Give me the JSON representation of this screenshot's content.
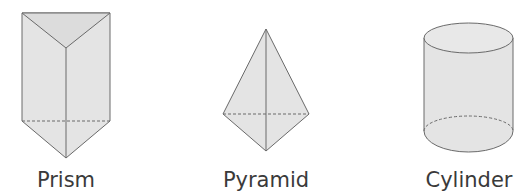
{
  "shapes": [
    {
      "name": "prism",
      "label": "Prism"
    },
    {
      "name": "pyramid",
      "label": "Pyramid"
    },
    {
      "name": "cylinder",
      "label": "Cylinder"
    }
  ],
  "colors": {
    "fill": "#e4e4e4",
    "fill_dark": "#d9d9d9",
    "stroke": "#6a6a6a"
  }
}
